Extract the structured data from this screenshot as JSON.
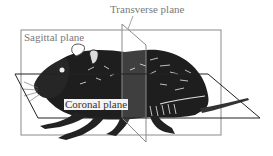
{
  "diagram": {
    "labels": {
      "transverse": "Transverse plane",
      "sagittal": "Sagittal plane",
      "coronal": "Coronal plane"
    },
    "colors": {
      "plane_line": "#8a8a8a",
      "coronal_line": "#222222",
      "body": "#1e1e1e",
      "label_text": "#7a7a7a"
    }
  }
}
